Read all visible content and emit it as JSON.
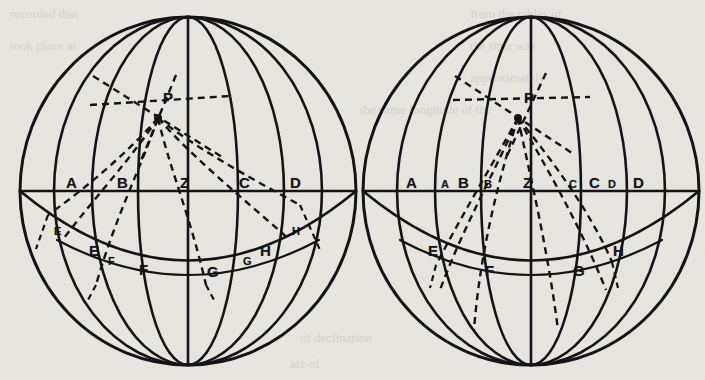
{
  "figure": {
    "background_color": "#e9e7e2",
    "ink_color": "#141414",
    "panels": [
      {
        "id": "left",
        "name": "left-sphere",
        "center": [
          188,
          191
        ],
        "radius_x": 168,
        "radius_y": 174,
        "pole_top": [
          188,
          17
        ],
        "pole_bottom": [
          188,
          365
        ],
        "point_P": [
          158,
          118
        ],
        "meridian_count": 7,
        "labels": [
          {
            "text": "A",
            "x": 66,
            "y": 175,
            "size": "big"
          },
          {
            "text": "B",
            "x": 117,
            "y": 175,
            "size": "big"
          },
          {
            "text": "Z",
            "x": 180,
            "y": 175,
            "size": "big"
          },
          {
            "text": "C",
            "x": 239,
            "y": 175,
            "size": "big"
          },
          {
            "text": "D",
            "x": 290,
            "y": 175,
            "size": "big"
          },
          {
            "text": "P",
            "x": 163,
            "y": 90,
            "size": "big"
          },
          {
            "text": "E",
            "x": 54,
            "y": 226,
            "size": "small"
          },
          {
            "text": "E",
            "x": 89,
            "y": 243,
            "size": "big"
          },
          {
            "text": "F",
            "x": 108,
            "y": 256,
            "size": "small"
          },
          {
            "text": "F",
            "x": 139,
            "y": 262,
            "size": "big"
          },
          {
            "text": "G",
            "x": 207,
            "y": 264,
            "size": "big"
          },
          {
            "text": "G",
            "x": 243,
            "y": 256,
            "size": "small"
          },
          {
            "text": "H",
            "x": 260,
            "y": 243,
            "size": "big"
          },
          {
            "text": "H",
            "x": 292,
            "y": 226,
            "size": "small"
          }
        ]
      },
      {
        "id": "right",
        "name": "right-sphere",
        "center": [
          531,
          191
        ],
        "radius_x": 168,
        "radius_y": 174,
        "pole_top": [
          531,
          17
        ],
        "pole_bottom": [
          531,
          365
        ],
        "point_P": [
          518,
          118
        ],
        "meridian_count": 7,
        "labels": [
          {
            "text": "A",
            "x": 406,
            "y": 175,
            "size": "big"
          },
          {
            "text": "A",
            "x": 441,
            "y": 179,
            "size": "small"
          },
          {
            "text": "B",
            "x": 458,
            "y": 175,
            "size": "big"
          },
          {
            "text": "B",
            "x": 484,
            "y": 179,
            "size": "small"
          },
          {
            "text": "Z",
            "x": 523,
            "y": 175,
            "size": "big"
          },
          {
            "text": "C",
            "x": 569,
            "y": 179,
            "size": "small"
          },
          {
            "text": "C",
            "x": 589,
            "y": 175,
            "size": "big"
          },
          {
            "text": "D",
            "x": 608,
            "y": 179,
            "size": "small"
          },
          {
            "text": "D",
            "x": 633,
            "y": 175,
            "size": "big"
          },
          {
            "text": "P",
            "x": 524,
            "y": 90,
            "size": "big"
          },
          {
            "text": "E",
            "x": 428,
            "y": 243,
            "size": "big"
          },
          {
            "text": "F",
            "x": 485,
            "y": 263,
            "size": "big"
          },
          {
            "text": "G",
            "x": 573,
            "y": 263,
            "size": "big"
          },
          {
            "text": "H",
            "x": 613,
            "y": 243,
            "size": "big"
          }
        ]
      }
    ],
    "ghost_text": [
      {
        "text": "recorded that",
        "x": 10,
        "y": 6
      },
      {
        "text": "from the tables of",
        "x": 470,
        "y": 6
      },
      {
        "text": "took place at",
        "x": 10,
        "y": 38
      },
      {
        "text": "the time was",
        "x": 470,
        "y": 38
      },
      {
        "text": "approximately",
        "x": 470,
        "y": 70
      },
      {
        "text": "the same longitude of the",
        "x": 360,
        "y": 102
      },
      {
        "text": "of declination",
        "x": 300,
        "y": 330
      },
      {
        "text": "arc of",
        "x": 290,
        "y": 356
      }
    ]
  }
}
